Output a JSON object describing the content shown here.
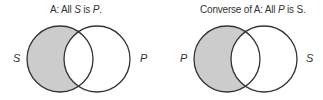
{
  "diagrams": [
    {
      "title_prefix": "A:  All ",
      "title_subject": "S",
      "title_mid": " is ",
      "title_predicate": "P",
      "title_suffix": ".",
      "left_label": "S",
      "right_label": "P",
      "shaded_region": "left circle outside right circle"
    },
    {
      "title_prefix": "Converse of A:  All ",
      "title_subject": "P",
      "title_mid": " is ",
      "title_predicate": "S",
      "title_suffix": ".",
      "left_label": "P",
      "right_label": "S",
      "shaded_region": "left circle outside right circle"
    }
  ],
  "colors": {
    "shade": "#cccccc",
    "stroke": "#333333"
  }
}
